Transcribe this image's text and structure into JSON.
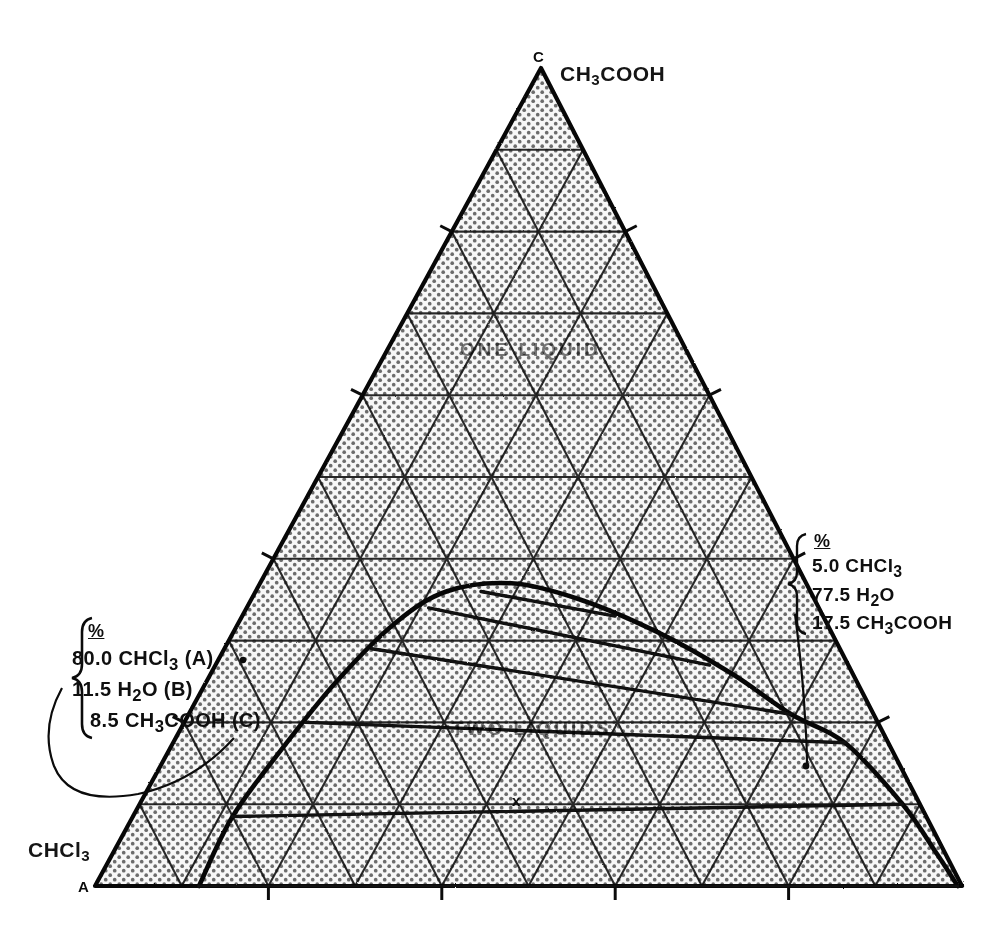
{
  "figure": {
    "type": "ternary-phase-diagram",
    "system": "CHCl3 - H2O - CH3COOH"
  },
  "vertices": {
    "top": {
      "letter": "C",
      "label_main": "CH",
      "label_sub1": "3",
      "label_tail": "COOH"
    },
    "bottom_left": {
      "letter": "A",
      "label_main": "CHCl",
      "label_sub1": "3",
      "label_tail": ""
    },
    "bottom_right": {
      "letter": "B",
      "label_main": "",
      "label_sub1": "",
      "label_tail": ""
    }
  },
  "regions": {
    "one_liquid": "ONE LIQUID",
    "two_liquids": "TWO LIQUIDS"
  },
  "callout_left": {
    "header": "%",
    "rows": [
      {
        "value": "80.0",
        "species": "CHCl",
        "sub": "3",
        "tail": "",
        "tag": "(A)"
      },
      {
        "value": "11.5",
        "species": "H",
        "sub": "2",
        "tail": "O",
        "tag": "(B)"
      },
      {
        "value": "8.5",
        "species": "CH",
        "sub": "3",
        "tail": "COOH",
        "tag": "(C)"
      }
    ]
  },
  "callout_right": {
    "header": "%",
    "rows": [
      {
        "value": "5.0",
        "species": "CHCl",
        "sub": "3",
        "tail": "",
        "tag": ""
      },
      {
        "value": "77.5",
        "species": "H",
        "sub": "2",
        "tail": "O",
        "tag": ""
      },
      {
        "value": "17.5",
        "species": "CH",
        "sub": "3",
        "tail": "COOH",
        "tag": ""
      }
    ]
  },
  "markers": {
    "tie_line_point": "x"
  },
  "chart_data": {
    "type": "scatter",
    "components": [
      "CHCl3 (A)",
      "H2O (B)",
      "CH3COOH (C)"
    ],
    "axis_divisions": 10,
    "grid": true,
    "xlabel": "",
    "ylabel": "",
    "annotations": [
      "ONE LIQUID",
      "TWO LIQUIDS"
    ],
    "binodal_curve": [
      {
        "A": 0.88,
        "B": 0.12,
        "C": 0.0
      },
      {
        "A": 0.8,
        "B": 0.115,
        "C": 0.085
      },
      {
        "A": 0.7,
        "B": 0.13,
        "C": 0.17
      },
      {
        "A": 0.6,
        "B": 0.15,
        "C": 0.25
      },
      {
        "A": 0.5,
        "B": 0.18,
        "C": 0.32
      },
      {
        "A": 0.42,
        "B": 0.22,
        "C": 0.36
      },
      {
        "A": 0.34,
        "B": 0.29,
        "C": 0.37
      },
      {
        "A": 0.27,
        "B": 0.38,
        "C": 0.35
      },
      {
        "A": 0.2,
        "B": 0.49,
        "C": 0.31
      },
      {
        "A": 0.14,
        "B": 0.6,
        "C": 0.26
      },
      {
        "A": 0.095,
        "B": 0.695,
        "C": 0.21
      },
      {
        "A": 0.05,
        "B": 0.775,
        "C": 0.175
      },
      {
        "A": 0.02,
        "B": 0.88,
        "C": 0.1
      },
      {
        "A": 0.01,
        "B": 0.95,
        "C": 0.04
      },
      {
        "A": 0.005,
        "B": 0.995,
        "C": 0.0
      }
    ],
    "tie_lines": [
      {
        "left": {
          "A": 0.88,
          "B": 0.12,
          "C": 0.0
        },
        "right": {
          "A": 0.005,
          "B": 0.995,
          "C": 0.0
        }
      },
      {
        "left": {
          "A": 0.8,
          "B": 0.115,
          "C": 0.085
        },
        "right": {
          "A": 0.02,
          "B": 0.88,
          "C": 0.1
        }
      },
      {
        "left": {
          "A": 0.66,
          "B": 0.14,
          "C": 0.2
        },
        "right": {
          "A": 0.05,
          "B": 0.775,
          "C": 0.175
        }
      },
      {
        "left": {
          "A": 0.54,
          "B": 0.17,
          "C": 0.29
        },
        "right": {
          "A": 0.095,
          "B": 0.695,
          "C": 0.21
        }
      },
      {
        "left": {
          "A": 0.45,
          "B": 0.21,
          "C": 0.34
        },
        "right": {
          "A": 0.16,
          "B": 0.57,
          "C": 0.27
        }
      },
      {
        "left": {
          "A": 0.38,
          "B": 0.26,
          "C": 0.36
        },
        "right": {
          "A": 0.24,
          "B": 0.43,
          "C": 0.33
        }
      }
    ],
    "plait_point": {
      "A": 0.32,
      "B": 0.32,
      "C": 0.36
    },
    "labelled_points": [
      {
        "name": "A-rich layer",
        "A": 0.8,
        "B": 0.115,
        "C": 0.085
      },
      {
        "name": "B-rich layer",
        "A": 0.05,
        "B": 0.775,
        "C": 0.175
      }
    ]
  }
}
